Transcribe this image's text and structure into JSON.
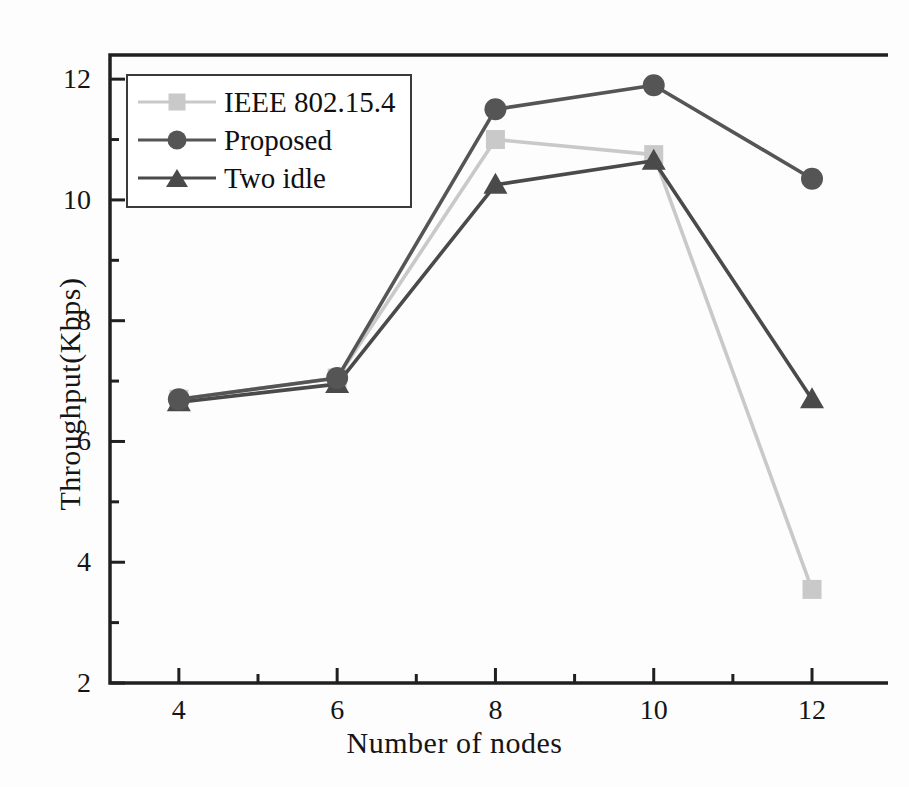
{
  "chart_data": {
    "type": "line",
    "title": "",
    "xlabel": "Number of nodes",
    "ylabel": "Throughput(Kbps)",
    "x": [
      4,
      6,
      8,
      10,
      12
    ],
    "xlim": [
      3.13,
      12.96
    ],
    "ylim": [
      2,
      12.4
    ],
    "xticks": [
      4,
      6,
      8,
      10,
      12
    ],
    "xtick_labels": [
      "4",
      "6",
      "8",
      "10",
      "12"
    ],
    "xminor_ticks": [
      5,
      7,
      9,
      11
    ],
    "yticks": [
      2,
      4,
      6,
      8,
      10,
      12
    ],
    "ytick_labels": [
      "2",
      "4",
      "6",
      "8",
      "10",
      "12"
    ],
    "yminor_ticks": [
      3,
      5,
      7,
      9,
      11
    ],
    "grid": false,
    "legend_position": "upper left",
    "series": [
      {
        "name": "IEEE 802.15.4",
        "marker": "square",
        "color": "#c9c9c9",
        "values": [
          6.7,
          7.05,
          11.0,
          10.75,
          3.55
        ]
      },
      {
        "name": "Proposed",
        "marker": "circle",
        "color": "#555555",
        "values": [
          6.7,
          7.05,
          11.5,
          11.9,
          10.35
        ]
      },
      {
        "name": "Two idle",
        "marker": "triangle",
        "color": "#4a4a4a",
        "values": [
          6.65,
          6.95,
          10.25,
          10.65,
          6.7
        ]
      }
    ]
  },
  "axes": {
    "frame_color": "#202020"
  }
}
